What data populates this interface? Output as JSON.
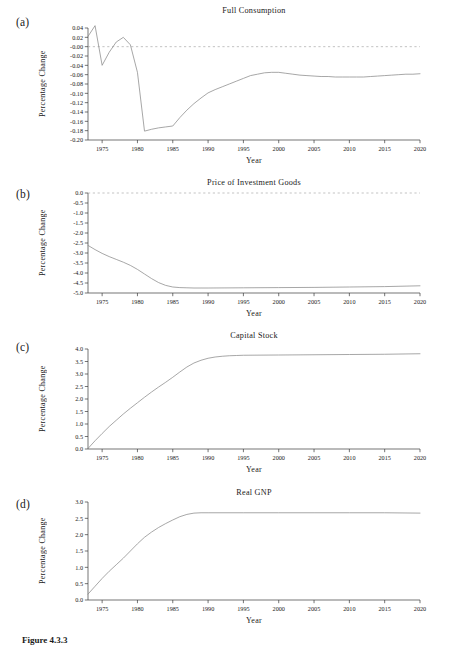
{
  "figure": {
    "caption": "Figure 4.3.3",
    "xlabel": "Year",
    "ylabel": "Percentage Change",
    "line_color": "#8a8a8a",
    "axis_color": "#3a3a3a",
    "zero_line_color": "#9a9a9a"
  },
  "panels": [
    {
      "letter": "(a)",
      "title": "Full Consumption"
    },
    {
      "letter": "(b)",
      "title": "Price of Investment Goods"
    },
    {
      "letter": "(c)",
      "title": "Capital Stock"
    },
    {
      "letter": "(d)",
      "title": "Real GNP"
    }
  ],
  "chart_data": [
    {
      "type": "line",
      "panel": "(a)",
      "title": "Full Consumption",
      "xlabel": "Year",
      "ylabel": "Percentage Change",
      "xlim": [
        1973,
        2020
      ],
      "ylim": [
        -0.2,
        0.04
      ],
      "grid": false,
      "legend": "none",
      "zero_reference_line": 0.0,
      "xticks": [
        1975,
        1980,
        1985,
        1990,
        1995,
        2000,
        2005,
        2010,
        2015,
        2020
      ],
      "yticks": [
        0.04,
        0.02,
        -0.0,
        -0.02,
        -0.04,
        -0.06,
        -0.08,
        -0.1,
        -0.12,
        -0.14,
        -0.16,
        -0.18,
        -0.2
      ],
      "ytick_labels": [
        "0.04",
        "0.02",
        "-0.00",
        "-0.02",
        "-0.04",
        "-0.06",
        "-0.08",
        "-0.10",
        "-0.12",
        "-0.14",
        "-0.16",
        "-0.18",
        "-0.20"
      ],
      "x": [
        1973,
        1974,
        1975,
        1976,
        1977,
        1978,
        1979,
        1980,
        1981,
        1982,
        1983,
        1984,
        1985,
        1986,
        1987,
        1988,
        1989,
        1990,
        1991,
        1992,
        1993,
        1994,
        1995,
        1996,
        1997,
        1998,
        1999,
        2000,
        2001,
        2002,
        2003,
        2004,
        2005,
        2006,
        2007,
        2008,
        2009,
        2010,
        2011,
        2012,
        2013,
        2014,
        2015,
        2016,
        2017,
        2018,
        2019,
        2020
      ],
      "y": [
        0.022,
        0.045,
        -0.04,
        -0.012,
        0.01,
        0.02,
        0.004,
        -0.055,
        -0.181,
        -0.177,
        -0.174,
        -0.172,
        -0.17,
        -0.152,
        -0.136,
        -0.122,
        -0.11,
        -0.099,
        -0.092,
        -0.086,
        -0.08,
        -0.074,
        -0.068,
        -0.062,
        -0.059,
        -0.056,
        -0.055,
        -0.055,
        -0.057,
        -0.059,
        -0.061,
        -0.062,
        -0.063,
        -0.064,
        -0.064,
        -0.065,
        -0.065,
        -0.065,
        -0.065,
        -0.065,
        -0.064,
        -0.063,
        -0.062,
        -0.061,
        -0.06,
        -0.059,
        -0.059,
        -0.058
      ]
    },
    {
      "type": "line",
      "panel": "(b)",
      "title": "Price of Investment Goods",
      "xlabel": "Year",
      "ylabel": "Percentage Change",
      "xlim": [
        1973,
        2020
      ],
      "ylim": [
        -5.0,
        0.0
      ],
      "grid": false,
      "legend": "none",
      "zero_reference_line": 0.0,
      "xticks": [
        1975,
        1980,
        1985,
        1990,
        1995,
        2000,
        2005,
        2010,
        2015,
        2020
      ],
      "yticks": [
        0.0,
        -0.5,
        -1.0,
        -1.5,
        -2.0,
        -2.5,
        -3.0,
        -3.5,
        -4.0,
        -4.5,
        -5.0
      ],
      "ytick_labels": [
        "0.0",
        "-0.5",
        "-1.0",
        "-1.5",
        "-2.0",
        "-2.5",
        "-3.0",
        "-3.5",
        "-4.0",
        "-4.5",
        "-5.0"
      ],
      "x": [
        1973,
        1974,
        1975,
        1976,
        1977,
        1978,
        1979,
        1980,
        1981,
        1982,
        1983,
        1984,
        1985,
        1986,
        1987,
        1988,
        1989,
        1990,
        1995,
        2000,
        2005,
        2010,
        2015,
        2020
      ],
      "y": [
        -2.62,
        -2.83,
        -3.02,
        -3.18,
        -3.32,
        -3.46,
        -3.62,
        -3.82,
        -4.05,
        -4.28,
        -4.48,
        -4.62,
        -4.7,
        -4.73,
        -4.74,
        -4.75,
        -4.75,
        -4.75,
        -4.74,
        -4.73,
        -4.72,
        -4.7,
        -4.68,
        -4.64
      ]
    },
    {
      "type": "line",
      "panel": "(c)",
      "title": "Capital Stock",
      "xlabel": "Year",
      "ylabel": "Percentage Change",
      "xlim": [
        1973,
        2020
      ],
      "ylim": [
        0.0,
        4.0
      ],
      "grid": false,
      "legend": "none",
      "xticks": [
        1975,
        1980,
        1985,
        1990,
        1995,
        2000,
        2005,
        2010,
        2015,
        2020
      ],
      "yticks": [
        0.0,
        0.5,
        1.0,
        1.5,
        2.0,
        2.5,
        3.0,
        3.5,
        4.0
      ],
      "ytick_labels": [
        "0.0",
        "0.5",
        "1.0",
        "1.5",
        "2.0",
        "2.5",
        "3.0",
        "3.5",
        "4.0"
      ],
      "x": [
        1973,
        1974,
        1975,
        1976,
        1977,
        1978,
        1979,
        1980,
        1981,
        1982,
        1983,
        1984,
        1985,
        1986,
        1987,
        1988,
        1989,
        1990,
        1991,
        1992,
        1993,
        1994,
        1995,
        2000,
        2005,
        2010,
        2015,
        2020
      ],
      "y": [
        0.02,
        0.33,
        0.62,
        0.9,
        1.15,
        1.4,
        1.63,
        1.85,
        2.07,
        2.28,
        2.48,
        2.67,
        2.87,
        3.08,
        3.28,
        3.44,
        3.55,
        3.63,
        3.68,
        3.71,
        3.73,
        3.74,
        3.75,
        3.76,
        3.77,
        3.78,
        3.79,
        3.81
      ]
    },
    {
      "type": "line",
      "panel": "(d)",
      "title": "Real GNP",
      "xlabel": "Year",
      "ylabel": "Percentage Change",
      "xlim": [
        1973,
        2020
      ],
      "ylim": [
        0.0,
        3.0
      ],
      "grid": false,
      "legend": "none",
      "xticks": [
        1975,
        1980,
        1985,
        1990,
        1995,
        2000,
        2005,
        2010,
        2015,
        2020
      ],
      "yticks": [
        0.0,
        0.5,
        1.0,
        1.5,
        2.0,
        2.5,
        3.0
      ],
      "ytick_labels": [
        "0.0",
        "0.5",
        "1.0",
        "1.5",
        "2.0",
        "2.5",
        "3.0"
      ],
      "x": [
        1973,
        1974,
        1975,
        1976,
        1977,
        1978,
        1979,
        1980,
        1981,
        1982,
        1983,
        1984,
        1985,
        1986,
        1987,
        1988,
        1989,
        1990,
        1995,
        2000,
        2005,
        2010,
        2015,
        2020
      ],
      "y": [
        0.18,
        0.42,
        0.66,
        0.88,
        1.08,
        1.28,
        1.5,
        1.72,
        1.92,
        2.08,
        2.22,
        2.34,
        2.45,
        2.55,
        2.62,
        2.66,
        2.67,
        2.67,
        2.67,
        2.67,
        2.67,
        2.67,
        2.67,
        2.66
      ]
    }
  ]
}
